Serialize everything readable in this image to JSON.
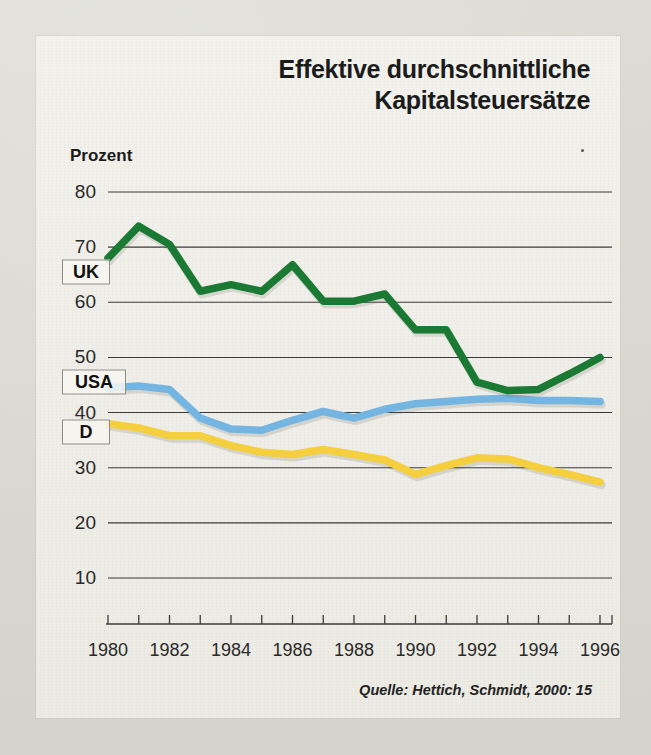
{
  "chart_data": {
    "type": "line",
    "title": "Effektive durchschnittliche Kapitalsteuersätze",
    "title_line1": "Effektive durchschnittliche",
    "title_line2": "Kapitalsteuersätze",
    "ylabel": "Prozent",
    "xlabel": "",
    "source": "Quelle: Hettich, Schmidt, 2000: 15",
    "grid": true,
    "legend_position": "inline-labels",
    "ylim": [
      0,
      85
    ],
    "xlim": [
      1980,
      1996
    ],
    "ytick_values": [
      10,
      20,
      30,
      40,
      50,
      60,
      70,
      80
    ],
    "ytick_labels": [
      "10",
      "20",
      "30",
      "40",
      "50",
      "60",
      "70",
      "80"
    ],
    "x": [
      1980,
      1981,
      1982,
      1983,
      1984,
      1985,
      1986,
      1987,
      1988,
      1989,
      1990,
      1991,
      1992,
      1993,
      1994,
      1995,
      1996
    ],
    "xtick_labels": [
      "1980",
      "1982",
      "1984",
      "1986",
      "1988",
      "1990",
      "1992",
      "1994",
      "1996"
    ],
    "xtick_values": [
      1980,
      1982,
      1984,
      1986,
      1988,
      1990,
      1992,
      1994,
      1996
    ],
    "series": [
      {
        "name": "UK",
        "color": "#1a7a33",
        "values": [
          68.0,
          73.8,
          70.5,
          62.0,
          63.2,
          62.0,
          66.8,
          60.2,
          60.2,
          61.5,
          55.0,
          55.0,
          45.5,
          44.0,
          44.2,
          47.0,
          50.0
        ]
      },
      {
        "name": "USA",
        "color": "#74b5e2",
        "values": [
          44.5,
          44.8,
          44.2,
          39.0,
          37.0,
          36.8,
          38.6,
          40.2,
          39.0,
          40.6,
          41.6,
          42.0,
          42.4,
          42.6,
          42.2,
          42.2,
          42.0
        ]
      },
      {
        "name": "D",
        "color": "#f5cf3e",
        "values": [
          38.0,
          37.2,
          35.8,
          35.8,
          34.0,
          32.8,
          32.4,
          33.3,
          32.4,
          31.4,
          28.8,
          30.4,
          31.8,
          31.6,
          30.0,
          28.8,
          27.4
        ]
      }
    ],
    "series_label_boxes": [
      {
        "name": "UK",
        "value": 65.5
      },
      {
        "name": "USA",
        "value": 45.5
      },
      {
        "name": "D",
        "value": 36.5
      }
    ]
  }
}
